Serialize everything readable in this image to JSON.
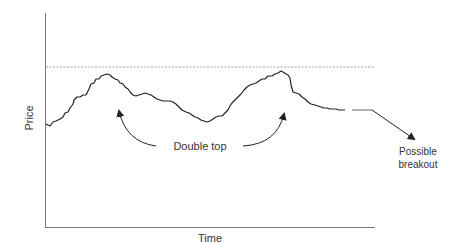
{
  "chart_data": {
    "type": "line",
    "title": "",
    "xlabel": "Time",
    "ylabel": "Price",
    "grid": false,
    "legend": null,
    "axis_ticks": false,
    "pattern": "Double top",
    "resistance_level": {
      "style": "dashed",
      "y_pixel": 67,
      "description": "resistance line at the height of the double top"
    },
    "series": [
      {
        "name": "Price",
        "points": [
          [
            46,
            124
          ],
          [
            50,
            126
          ],
          [
            53,
            122
          ],
          [
            56,
            121
          ],
          [
            60,
            119
          ],
          [
            63,
            117
          ],
          [
            65,
            113
          ],
          [
            68,
            112
          ],
          [
            70,
            108
          ],
          [
            73,
            104
          ],
          [
            74,
            100
          ],
          [
            77,
            97
          ],
          [
            80,
            97
          ],
          [
            83,
            95
          ],
          [
            86,
            95
          ],
          [
            89,
            89
          ],
          [
            91,
            84
          ],
          [
            94,
            83
          ],
          [
            96,
            79
          ],
          [
            99,
            79
          ],
          [
            101,
            76
          ],
          [
            104,
            75
          ],
          [
            107,
            74
          ],
          [
            110,
            75
          ],
          [
            112,
            77
          ],
          [
            115,
            79
          ],
          [
            118,
            80
          ],
          [
            120,
            83
          ],
          [
            123,
            84
          ],
          [
            125,
            87
          ],
          [
            128,
            89
          ],
          [
            130,
            92
          ],
          [
            133,
            95
          ],
          [
            136,
            96
          ],
          [
            139,
            95
          ],
          [
            142,
            94
          ],
          [
            145,
            93
          ],
          [
            148,
            94
          ],
          [
            151,
            95
          ],
          [
            154,
            97
          ],
          [
            157,
            99
          ],
          [
            160,
            100
          ],
          [
            163,
            101
          ],
          [
            166,
            101
          ],
          [
            170,
            101
          ],
          [
            173,
            102
          ],
          [
            176,
            104
          ],
          [
            179,
            107
          ],
          [
            182,
            110
          ],
          [
            186,
            112
          ],
          [
            189,
            113
          ],
          [
            192,
            115
          ],
          [
            195,
            117
          ],
          [
            198,
            118
          ],
          [
            201,
            120
          ],
          [
            204,
            121
          ],
          [
            207,
            122
          ],
          [
            210,
            121
          ],
          [
            213,
            119
          ],
          [
            216,
            117
          ],
          [
            219,
            116
          ],
          [
            222,
            116
          ],
          [
            225,
            113
          ],
          [
            228,
            110
          ],
          [
            230,
            106
          ],
          [
            232,
            103
          ],
          [
            235,
            100
          ],
          [
            238,
            97
          ],
          [
            241,
            94
          ],
          [
            244,
            90
          ],
          [
            247,
            87
          ],
          [
            250,
            85
          ],
          [
            253,
            84
          ],
          [
            256,
            83
          ],
          [
            259,
            81
          ],
          [
            262,
            79
          ],
          [
            265,
            79
          ],
          [
            268,
            76
          ],
          [
            272,
            76
          ],
          [
            275,
            74
          ],
          [
            278,
            73
          ],
          [
            281,
            71
          ],
          [
            283,
            72
          ],
          [
            286,
            74
          ],
          [
            288,
            75
          ],
          [
            290,
            78
          ],
          [
            291,
            85
          ],
          [
            293,
            92
          ],
          [
            296,
            93
          ],
          [
            299,
            94
          ],
          [
            302,
            97
          ],
          [
            305,
            99
          ],
          [
            308,
            102
          ],
          [
            311,
            104
          ],
          [
            315,
            105
          ],
          [
            318,
            106
          ],
          [
            321,
            107
          ],
          [
            324,
            108
          ],
          [
            327,
            108
          ],
          [
            330,
            109
          ],
          [
            333,
            109
          ],
          [
            336,
            109
          ],
          [
            339,
            110
          ],
          [
            342,
            110
          ],
          [
            345,
            110
          ]
        ]
      }
    ],
    "annotations": [
      {
        "text": "Double top",
        "x": 165,
        "y": 147
      },
      {
        "text": "Possible",
        "x": 418,
        "y": 155
      },
      {
        "text": "breakout",
        "x": 418,
        "y": 168
      }
    ],
    "projection": {
      "segment": [
        [
          352,
          110
        ],
        [
          372,
          110
        ]
      ],
      "arrow_to": [
        415,
        140
      ],
      "label": "Possible breakout"
    },
    "axes": {
      "origin": [
        45,
        227
      ],
      "x_end": 375,
      "y_top": 13
    }
  },
  "labels": {
    "x_axis": "Time",
    "y_axis": "Price",
    "pattern_label": "Double top",
    "breakout_line1": "Possible",
    "breakout_line2": "breakout"
  },
  "colors": {
    "line": "#222222",
    "axis": "#777777",
    "dashed": "#8a8a8a",
    "projection": "#888888",
    "text": "#333333"
  }
}
